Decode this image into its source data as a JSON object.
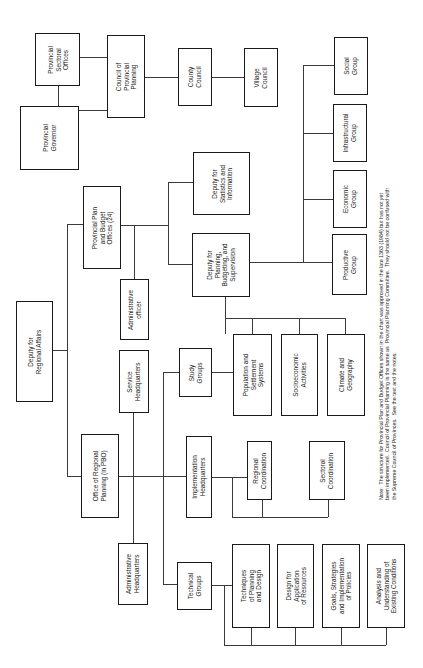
{
  "chart": {
    "orientation": "rotated-90-ccw",
    "nodes": {
      "provincial_sectoral_offices": "Provincial\nSectoral\nOffices",
      "provincial_governor": "Provincial\nGovernor",
      "council_provincial_planning": "Council of\nProvincial\nPlanning",
      "county_council": "County\nCouncil",
      "village_council": "Village\nCouncil",
      "provincial_plan_budget_offices": "Provincial Plan\nand Budget\nOffices (24)",
      "administrative_officer": "Administrative\nofficer",
      "deputy_statistics": "Deputy for\nStatistics and\nInformation",
      "deputy_planning": "Deputy for\nPlanning,\nBudgeting, and\nSupervision",
      "productive_group": "Productive\nGroup",
      "economic_group": "Economic\nGroup",
      "infrastructural_group": "Infrastructural\nGroup",
      "social_group": "Social\nGroup",
      "deputy_regional_affairs": "Deputy for\nRegional Affairs",
      "service_headquarters": "Service\nHeadquarters",
      "office_regional_planning": "Office of Regional\nPlanning (in PBO)",
      "administrative_headquarters": "Administrative\nHeadquarters",
      "study_groups": "Study\nGroups",
      "implementation_headquarters": "Implementation\nHeadquarters",
      "technical_groups": "Technical\nGroups",
      "population_settlement": "Population and\nSettlement\nSystems",
      "socioeconomic_activities": "Socioeconomic\nActivities",
      "climate_geography": "Climate and\nGeography",
      "regional_coordination": "Regional\nCoordination",
      "sectoral_coordination": "Sectoral\nCoordination",
      "techniques_planning_design": "Techniques\nof Planning\nand Design",
      "design_application_resources": "Design for\nApplication\nof Resources",
      "goals_strategies": "Goals, Strategies\nand Implementation\nof Policies",
      "analysis_existing_conditions": "Analysis and\nUnderstanding of\nExisting Conditions"
    },
    "note": "Note:  The structure for Provincial Plan and Budget Offices shown in the chart was approved in the late 1363 (1984) but has not yet\nbeen implemented.  Council of Provincial Planning is the same as  Provincial Planning Committee.  They should not be confused with\nthe Supreme Council of Provinces.  See the text and the notes."
  }
}
